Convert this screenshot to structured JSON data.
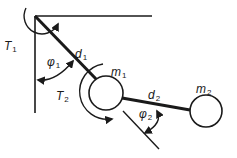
{
  "diagram": {
    "type": "double-pendulum",
    "colors": {
      "stroke": "#1a1a1a",
      "background": "#ffffff"
    },
    "labels": {
      "T1": {
        "base": "T",
        "sub": "1"
      },
      "d1": {
        "base": "d",
        "sub": "1"
      },
      "phi1": {
        "base": "φ",
        "sub": "1"
      },
      "m1": {
        "base": "m",
        "sub": "1"
      },
      "T2": {
        "base": "T",
        "sub": "2"
      },
      "d2": {
        "base": "d",
        "sub": "2"
      },
      "phi2": {
        "base": "φ",
        "sub": "2"
      },
      "m2": {
        "base": "m",
        "sub": "2"
      }
    }
  }
}
